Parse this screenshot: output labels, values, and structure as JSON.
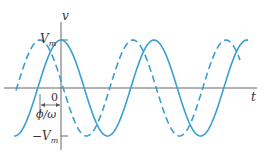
{
  "diagram": {
    "axis_labels": {
      "vertical": "v",
      "horizontal": "t"
    },
    "tick_labels": {
      "positive_peak": "V",
      "positive_peak_sub": "m",
      "negative_peak_sign": "−",
      "negative_peak": "V",
      "negative_peak_sub": "m",
      "origin": "0"
    },
    "phase_annotation": "ϕ/ω",
    "colors": {
      "curve": "#3a9fd0",
      "axis": "#666666"
    },
    "curves": [
      {
        "name": "solid",
        "style": "solid",
        "description": "v = Vm cos(ωt)"
      },
      {
        "name": "dashed",
        "style": "dashed",
        "description": "leads by ϕ/ω"
      }
    ]
  }
}
